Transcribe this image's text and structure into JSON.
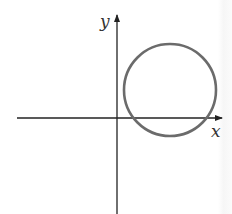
{
  "diagram": {
    "type": "coordinate-plane-with-circle",
    "axes": {
      "x_label": "x",
      "y_label": "y",
      "color": "#222222"
    },
    "circle": {
      "description": "circle located in first quadrant region, crossing positive x-axis twice",
      "color": "#6b6b6b",
      "cx": 170,
      "cy": 90,
      "r": 46
    }
  }
}
